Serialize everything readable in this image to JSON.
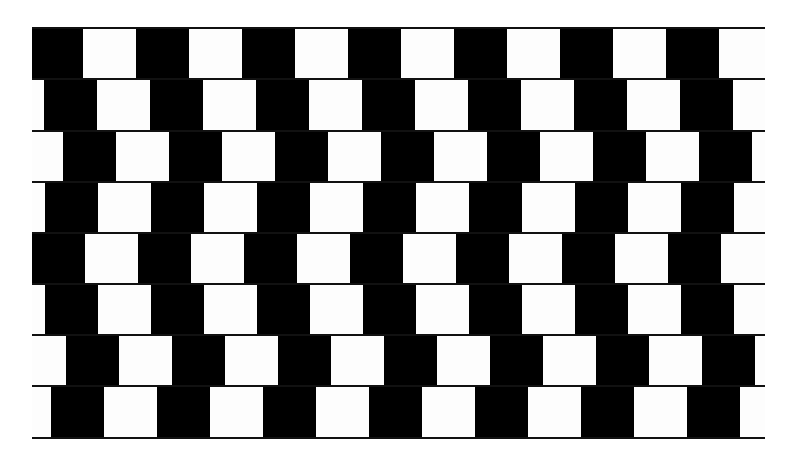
{
  "figure": {
    "name": "Café wall illusion",
    "colors": {
      "dark": "#000000",
      "light": "#fdfdfd",
      "mortar": "#111111",
      "background": "#ffffff"
    },
    "geometry": {
      "left": 32,
      "right": 765,
      "row_tops": [
        28,
        79,
        131,
        182,
        233,
        284,
        335,
        386
      ],
      "row_height": 51,
      "bottom": 438,
      "period": 106,
      "tile_width": 53,
      "row_white_offsets": [
        83,
        97,
        116,
        98,
        85,
        98,
        119,
        104
      ]
    }
  }
}
